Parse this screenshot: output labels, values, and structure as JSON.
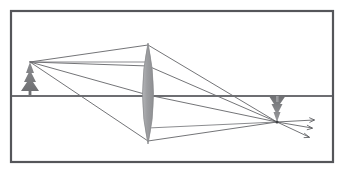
{
  "figure": {
    "caption": "",
    "background_color": "#ffffff",
    "width": 345,
    "height": 172
  },
  "frame": {
    "name": "image-border",
    "x": 11,
    "y": 11,
    "width": 322,
    "height": 151,
    "stroke_color": "#55565a",
    "stroke_width": 2.2
  },
  "optical_axis": {
    "label": "optical axis",
    "x1": 12,
    "y1": 96,
    "x2": 332,
    "y2": 96,
    "color": "#6d6e72",
    "width": 2.0
  },
  "lens": {
    "label": "converging lens",
    "center_x": 148,
    "center_y": 95,
    "top_y": 43,
    "bottom_y": 144,
    "half_width": 11,
    "fill_color": "#9d9ea1",
    "stroke_color": "#8a8b8e",
    "stroke_width": 0.8
  },
  "object_tree": {
    "label": "object tree",
    "tip_x": 30,
    "tip_y": 62,
    "base_y": 96,
    "half_base": 11,
    "color": "#7c7d80"
  },
  "image_tree": {
    "label": "inverted image tree",
    "tip_x": 277,
    "tip_y": 122,
    "base_y": 96,
    "half_base": 10,
    "color": "#8d8e91"
  },
  "focus_point": {
    "label": "image focus point",
    "x": 277,
    "y": 122
  },
  "rays": {
    "color": "#5a5b5f",
    "width": 0.85,
    "incident": [
      {
        "name": "ray-to-lens-top",
        "x1": 30,
        "y1": 62,
        "x2": 148,
        "y2": 45
      },
      {
        "name": "ray-to-lens-upper",
        "x1": 30,
        "y1": 62,
        "x2": 148,
        "y2": 66
      },
      {
        "name": "ray-to-lens-center",
        "x1": 30,
        "y1": 62,
        "x2": 148,
        "y2": 95
      },
      {
        "name": "ray-to-lens-bottom",
        "x1": 30,
        "y1": 62,
        "x2": 148,
        "y2": 141
      }
    ],
    "refracted": [
      {
        "name": "ray-from-lens-top",
        "x1": 148,
        "y1": 45,
        "x2": 277,
        "y2": 122
      },
      {
        "name": "ray-from-lens-upper",
        "x1": 148,
        "y1": 66,
        "x2": 277,
        "y2": 122
      },
      {
        "name": "ray-from-lens-center",
        "x1": 148,
        "y1": 95,
        "x2": 277,
        "y2": 122
      },
      {
        "name": "ray-from-lens-bottom",
        "x1": 148,
        "y1": 141,
        "x2": 277,
        "y2": 122
      }
    ],
    "horizontal_guides": [
      {
        "name": "parallel-ray-upper",
        "x1": 30,
        "y1": 62,
        "x2": 148,
        "y2": 62
      },
      {
        "name": "parallel-ray-lower",
        "x1": 148,
        "y1": 128,
        "x2": 277,
        "y2": 122
      }
    ]
  },
  "diverging_arrows": {
    "label": "diverging rays beyond image",
    "color": "#5a5b5f",
    "width": 0.85,
    "head_size": 3.2,
    "items": [
      {
        "name": "arrow-ray-1",
        "x1": 277,
        "y1": 122,
        "x2": 315,
        "y2": 120
      },
      {
        "name": "arrow-ray-2",
        "x1": 277,
        "y1": 122,
        "x2": 313,
        "y2": 128
      },
      {
        "name": "arrow-ray-3",
        "x1": 277,
        "y1": 122,
        "x2": 310,
        "y2": 137
      }
    ]
  }
}
